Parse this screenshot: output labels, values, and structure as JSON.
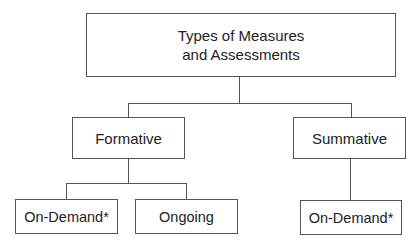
{
  "diagram": {
    "type": "hierarchy",
    "root": {
      "label_line1": "Types of Measures",
      "label_line2": "and Assessments"
    },
    "level2": [
      {
        "label": "Formative"
      },
      {
        "label": "Summative"
      }
    ],
    "level3": {
      "formative_children": [
        {
          "label": "On-Demand*"
        },
        {
          "label": "Ongoing"
        }
      ],
      "summative_children": [
        {
          "label": "On-Demand*"
        }
      ]
    },
    "colors": {
      "line": "#555555",
      "text": "#222222",
      "background": "#ffffff"
    }
  }
}
